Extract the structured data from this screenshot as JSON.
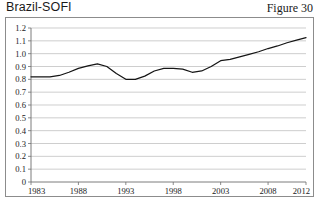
{
  "title": "Brazil-SOFI",
  "figure_label": "Figure 30",
  "chart_data": {
    "type": "line",
    "title": "Brazil-SOFI",
    "xlabel": "",
    "ylabel": "",
    "xlim": [
      1983,
      2012
    ],
    "ylim": [
      0,
      1.2
    ],
    "grid": true,
    "legend": false,
    "xticks": [
      "1983",
      "1988",
      "1993",
      "1998",
      "2003",
      "2008",
      "2012"
    ],
    "xtick_values": [
      1983,
      1988,
      1993,
      1998,
      2003,
      2008,
      2012
    ],
    "yticks": [
      "0",
      "0.1",
      "0.2",
      "0.3",
      "0.4",
      "0.5",
      "0.6",
      "0.7",
      "0.8",
      "0.9",
      "1.0",
      "1.1",
      "1.2"
    ],
    "ytick_values": [
      0,
      0.1,
      0.2,
      0.3,
      0.4,
      0.5,
      0.6,
      0.7,
      0.8,
      0.9,
      1.0,
      1.1,
      1.2
    ],
    "series": [
      {
        "name": "Brazil-SOFI",
        "color": "#151515",
        "x": [
          1983,
          1984,
          1985,
          1986,
          1987,
          1988,
          1989,
          1990,
          1991,
          1992,
          1993,
          1994,
          1995,
          1996,
          1997,
          1998,
          1999,
          2000,
          2001,
          2002,
          2003,
          2004,
          2005,
          2006,
          2007,
          2008,
          2009,
          2010,
          2011,
          2012
        ],
        "values": [
          0.82,
          0.82,
          0.82,
          0.83,
          0.855,
          0.885,
          0.905,
          0.92,
          0.9,
          0.845,
          0.8,
          0.8,
          0.825,
          0.865,
          0.885,
          0.885,
          0.88,
          0.855,
          0.865,
          0.9,
          0.945,
          0.955,
          0.975,
          0.995,
          1.015,
          1.04,
          1.06,
          1.085,
          1.105,
          1.125
        ]
      }
    ]
  }
}
